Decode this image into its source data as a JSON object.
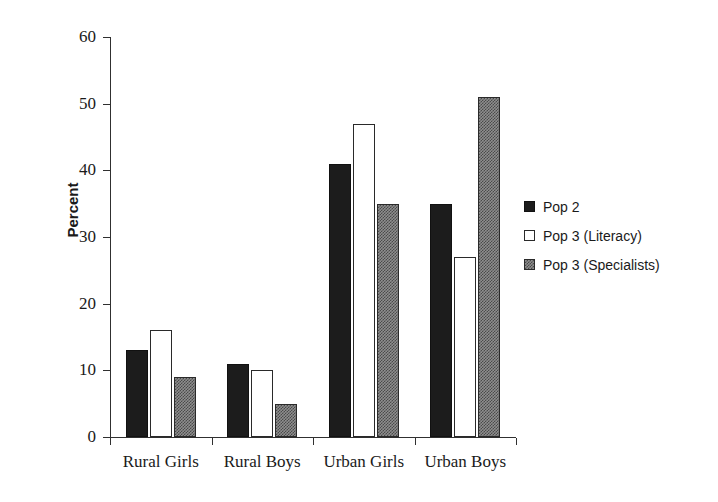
{
  "chart_data": {
    "type": "bar",
    "title": "",
    "subtitle": "",
    "xlabel": "",
    "ylabel": "Percent",
    "ylim": [
      0,
      60
    ],
    "ytick_values": [
      0,
      10,
      20,
      30,
      40,
      50,
      60
    ],
    "ytick_labels": [
      "0",
      "10",
      "20",
      "30",
      "40",
      "50",
      "60"
    ],
    "grid": false,
    "legend_position": "right",
    "categories": [
      "Rural Girls",
      "Rural Boys",
      "Urban Girls",
      "Urban Boys"
    ],
    "series": [
      {
        "name": "Pop 2",
        "fill": "solid-black",
        "color": "#1c1c1c",
        "values": [
          13,
          11,
          41,
          35
        ]
      },
      {
        "name": "Pop 3 (Literacy)",
        "fill": "hollow-white",
        "color": "#ffffff",
        "values": [
          16,
          10,
          47,
          27
        ]
      },
      {
        "name": "Pop 3 (Specialists)",
        "fill": "dither-grey",
        "color": "#8e8e8e",
        "values": [
          9,
          5,
          35,
          51
        ]
      }
    ]
  },
  "legend": {
    "items": [
      {
        "label": "Pop 2"
      },
      {
        "label": "Pop 3 (Literacy)"
      },
      {
        "label": "Pop 3 (Specialists)"
      }
    ]
  }
}
